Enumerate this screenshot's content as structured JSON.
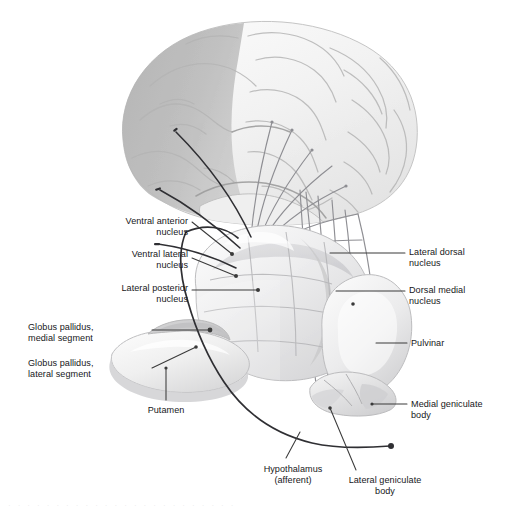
{
  "figure": {
    "background_color": "#ffffff",
    "label_color": "#17171a",
    "leader_color": "#3a3a3a",
    "fiber_color": "#8e8e93",
    "tract_color": "#2f2f33",
    "cortex_fill": "#f3f3f3",
    "cortex_shaded_fill": "#b9b9b9",
    "thalamus_fill": "#ececed",
    "thalamus_shade": "#c9c9ca",
    "putamen_fill": "#eeeeef",
    "pallidus_fill": "#cfcfd0"
  },
  "labels": [
    {
      "id": "ventral-anterior-nucleus",
      "text": "Ventral anterior\nnucleus",
      "align": "right",
      "x": 78,
      "y": 216,
      "w": 110
    },
    {
      "id": "ventral-lateral-nucleus",
      "text": "Ventral lateral\nnucleus",
      "align": "right",
      "x": 78,
      "y": 249,
      "w": 110
    },
    {
      "id": "lateral-posterior-nucleus",
      "text": "Lateral posterior\nnucleus",
      "align": "right",
      "x": 30,
      "y": 283,
      "w": 158
    },
    {
      "id": "globus-pallidus-medial-segment",
      "text": "Globus pallidus,\nmedial segment",
      "align": "left",
      "x": 28,
      "y": 322,
      "w": 120
    },
    {
      "id": "globus-pallidus-lateral-segment",
      "text": "Globus pallidus,\nlateral segment",
      "align": "left",
      "x": 28,
      "y": 358,
      "w": 120
    },
    {
      "id": "putamen",
      "text": "Putamen",
      "align": "center",
      "x": 126,
      "y": 405,
      "w": 80
    },
    {
      "id": "lateral-dorsal-nucleus",
      "text": "Lateral dorsal\nnucleus",
      "align": "left",
      "x": 409,
      "y": 247,
      "w": 100
    },
    {
      "id": "dorsal-medial-nucleus",
      "text": "Dorsal medial\nnucleus",
      "align": "left",
      "x": 409,
      "y": 285,
      "w": 100
    },
    {
      "id": "pulvinar",
      "text": "Pulvinar",
      "align": "left",
      "x": 411,
      "y": 338,
      "w": 80
    },
    {
      "id": "medial-geniculate-body",
      "text": "Medial geniculate\nbody",
      "align": "left",
      "x": 411,
      "y": 399,
      "w": 98
    },
    {
      "id": "hypothalamus-afferent",
      "text": "Hypothalamus\n(afferent)",
      "align": "center",
      "x": 243,
      "y": 464,
      "w": 100
    },
    {
      "id": "lateral-geniculate-body",
      "text": "Lateral geniculate\nbody",
      "align": "center",
      "x": 330,
      "y": 475,
      "w": 110
    }
  ],
  "structures": [
    {
      "id": "cerebral-cortex",
      "name": "Cerebral cortex, lateral view"
    },
    {
      "id": "frontal-lobe-shaded",
      "name": "Shaded frontal cortical region"
    },
    {
      "id": "thalamus-body",
      "name": "Thalamus"
    },
    {
      "id": "pulvinar-body",
      "name": "Pulvinar"
    },
    {
      "id": "geniculate-bodies",
      "name": "Medial and lateral geniculate bodies"
    },
    {
      "id": "putamen-body",
      "name": "Putamen"
    },
    {
      "id": "globus-pallidus-body",
      "name": "Globus pallidus"
    }
  ],
  "footer": {
    "clipped_text": "· · · · · · · · · · · · · · · · · · · · · · · ·"
  }
}
